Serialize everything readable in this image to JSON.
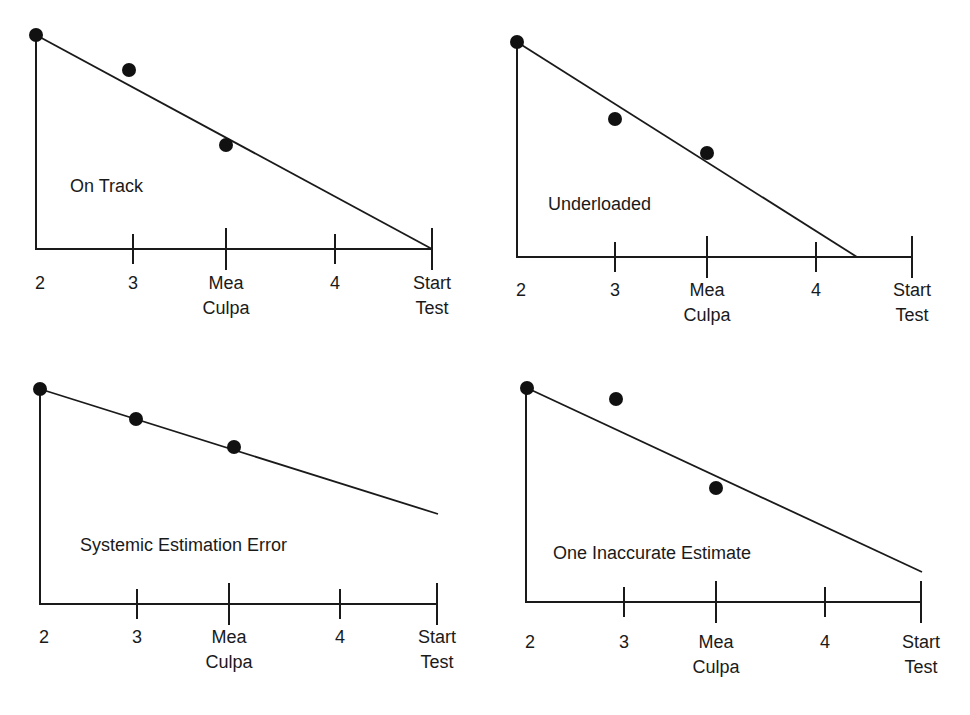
{
  "chart_data": [
    {
      "type": "line",
      "title": "On Track",
      "categories": [
        "2",
        "3",
        "Mea Culpa",
        "4",
        "Start Test"
      ],
      "xlabel": "",
      "ylabel": "",
      "grid": false,
      "series": [
        {
          "name": "Trend line",
          "x": [
            0,
            4
          ],
          "y": [
            100,
            0
          ],
          "note": "reaches zero exactly at Start Test"
        },
        {
          "name": "Actual points",
          "categories": [
            "2",
            "3",
            "Mea Culpa"
          ],
          "values": [
            100,
            84,
            49
          ]
        }
      ],
      "geometry": {
        "origin": [
          36,
          249
        ],
        "y_top": 35,
        "tick_x": [
          36,
          133,
          226,
          335,
          432
        ],
        "tick_tall": [
          false,
          false,
          true,
          false,
          true
        ],
        "line": [
          [
            36,
            35
          ],
          [
            432,
            249
          ]
        ],
        "points": [
          [
            36,
            35
          ],
          [
            129,
            70
          ],
          [
            226,
            145
          ]
        ],
        "title_pos": [
          70,
          192
        ],
        "label_y": 289
      }
    },
    {
      "type": "line",
      "title": "Underloaded",
      "categories": [
        "2",
        "3",
        "Mea Culpa",
        "4",
        "Start Test"
      ],
      "xlabel": "",
      "ylabel": "",
      "grid": false,
      "series": [
        {
          "name": "Trend line",
          "x": [
            0,
            3.55
          ],
          "y": [
            100,
            0
          ],
          "note": "reaches zero between 4 and Start Test"
        },
        {
          "name": "Actual points",
          "categories": [
            "2",
            "3",
            "Mea Culpa"
          ],
          "values": [
            100,
            64,
            48
          ]
        }
      ],
      "geometry": {
        "origin": [
          517,
          257
        ],
        "y_top": 42,
        "tick_x": [
          517,
          615,
          707,
          816,
          912
        ],
        "tick_tall": [
          false,
          false,
          true,
          false,
          true
        ],
        "line": [
          [
            517,
            42
          ],
          [
            857,
            257
          ]
        ],
        "points": [
          [
            517,
            42
          ],
          [
            615,
            119
          ],
          [
            707,
            153
          ]
        ],
        "title_pos": [
          548,
          210
        ],
        "label_y": 296
      }
    },
    {
      "type": "line",
      "title": "Systemic Estimation Error",
      "categories": [
        "2",
        "3",
        "Mea Culpa",
        "4",
        "Start Test"
      ],
      "xlabel": "",
      "ylabel": "",
      "grid": false,
      "series": [
        {
          "name": "Trend line",
          "x": [
            0,
            4
          ],
          "y": [
            100,
            42
          ],
          "note": "does not reach zero by Start Test"
        },
        {
          "name": "Actual points",
          "categories": [
            "2",
            "3",
            "Mea Culpa"
          ],
          "values": [
            100,
            86,
            73
          ]
        }
      ],
      "geometry": {
        "origin": [
          40,
          604
        ],
        "y_top": 389,
        "tick_x": [
          40,
          137,
          229,
          340,
          437
        ],
        "tick_tall": [
          false,
          false,
          true,
          false,
          true
        ],
        "line": [
          [
            40,
            389
          ],
          [
            438,
            514
          ]
        ],
        "points": [
          [
            40,
            389
          ],
          [
            136,
            419
          ],
          [
            234,
            447
          ]
        ],
        "title_pos": [
          80,
          551
        ],
        "label_y": 643
      }
    },
    {
      "type": "line",
      "title": "One Inaccurate Estimate",
      "categories": [
        "2",
        "3",
        "Mea Culpa",
        "4",
        "Start Test"
      ],
      "xlabel": "",
      "ylabel": "",
      "grid": false,
      "series": [
        {
          "name": "Trend line",
          "x": [
            0,
            4
          ],
          "y": [
            100,
            14
          ],
          "note": "does not reach zero by Start Test"
        },
        {
          "name": "Actual points",
          "categories": [
            "2",
            "3",
            "Mea Culpa"
          ],
          "values": [
            100,
            95,
            53
          ]
        }
      ],
      "geometry": {
        "origin": [
          526,
          602
        ],
        "y_top": 388,
        "tick_x": [
          526,
          624,
          716,
          825,
          921
        ],
        "tick_tall": [
          false,
          false,
          true,
          false,
          true
        ],
        "line": [
          [
            527,
            388
          ],
          [
            922,
            572
          ]
        ],
        "points": [
          [
            527,
            388
          ],
          [
            616,
            399
          ],
          [
            716,
            488
          ]
        ],
        "title_pos": [
          553,
          559
        ],
        "label_y": 648
      }
    }
  ],
  "axis_labels": [
    "2",
    "3",
    "Mea\nCulpa",
    "4",
    "Start\nTest"
  ],
  "colors": {
    "ink": "#1a1a1a",
    "point": "#111111",
    "background": "#ffffff"
  }
}
